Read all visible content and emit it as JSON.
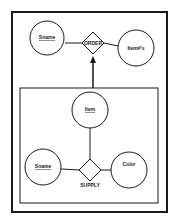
{
  "diagram": {
    "type": "entity-relationship (aggregation)",
    "outer": {
      "entities": [
        {
          "id": "e1",
          "label": "Sname",
          "underlined": true
        },
        {
          "id": "e2",
          "label": "Item#'s",
          "underlined": false
        }
      ],
      "relationship": {
        "id": "r1",
        "label": "ORDER"
      }
    },
    "aggregate": {
      "entities": [
        {
          "id": "e3",
          "label": "Item",
          "underlined": true
        },
        {
          "id": "e4",
          "label": "Sname",
          "underlined": true
        },
        {
          "id": "e5",
          "label": "Color",
          "underlined": false
        }
      ],
      "relationship": {
        "id": "r2",
        "label": "SUPPLY"
      }
    },
    "colors": {
      "stroke": "#1a1a1a",
      "background": "#ffffff"
    }
  }
}
